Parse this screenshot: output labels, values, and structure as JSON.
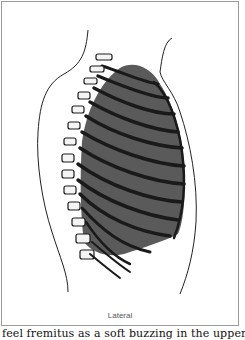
{
  "figure": {
    "caption": "Lateral",
    "colors": {
      "lung": "#5a5a5a",
      "ribs": "#1a1a1a",
      "outline": "#222222",
      "border": "#9a9a9a"
    }
  },
  "body_text": "feel fremitus as a soft buzzing in the upper"
}
